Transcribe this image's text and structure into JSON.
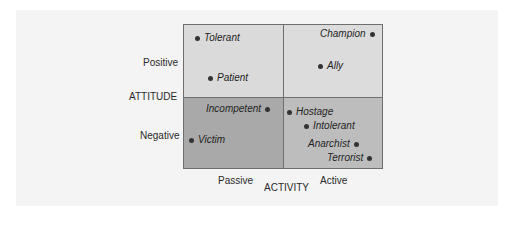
{
  "diagram": {
    "y_axis": {
      "title": "ATTITUDE",
      "levels": [
        "Positive",
        "Negative"
      ]
    },
    "x_axis": {
      "title": "ACTIVITY",
      "levels": [
        "Passive",
        "Active"
      ]
    },
    "colors": {
      "positive_passive": "#dadada",
      "positive_active": "#dcdcdc",
      "negative_passive": "#a9a9a9",
      "negative_active": "#bdbdbd",
      "border": "#6e6e6e",
      "dot": "#333333"
    },
    "points": [
      {
        "label": "Tolerant",
        "quadrant": "positive-passive"
      },
      {
        "label": "Patient",
        "quadrant": "positive-passive"
      },
      {
        "label": "Champion",
        "quadrant": "positive-active"
      },
      {
        "label": "Ally",
        "quadrant": "positive-active"
      },
      {
        "label": "Incompetent",
        "quadrant": "negative-passive"
      },
      {
        "label": "Victim",
        "quadrant": "negative-passive"
      },
      {
        "label": "Hostage",
        "quadrant": "negative-active"
      },
      {
        "label": "Intolerant",
        "quadrant": "negative-active"
      },
      {
        "label": "Anarchist",
        "quadrant": "negative-active"
      },
      {
        "label": "Terrorist",
        "quadrant": "negative-active"
      }
    ]
  }
}
